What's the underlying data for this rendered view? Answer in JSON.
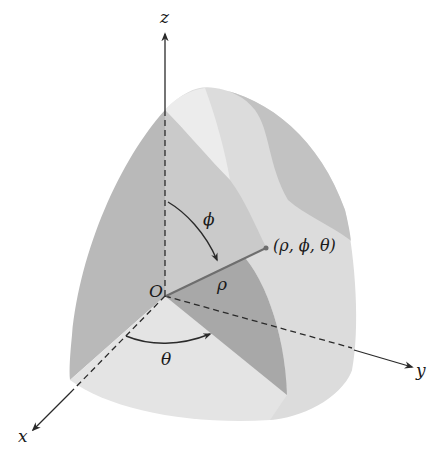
{
  "figure": {
    "type": "spherical-coordinates-diagram",
    "colors": {
      "background": "#ffffff",
      "left_face": "#b9b9b9",
      "outer_shell_light": "#dcdcdc",
      "outer_shell_dark": "#bfbfbf",
      "top_highlight": "#e9e9e9",
      "wedge_dark": "#a8a8a8",
      "floor_light": "#e4e4e4",
      "axis_color": "#2a2a2a",
      "rho_line": "#6e6e6e"
    },
    "axes": {
      "z_label": "z",
      "y_label": "y",
      "x_label": "x"
    },
    "labels": {
      "origin": "O",
      "phi_angle": "ϕ",
      "theta_angle": "θ",
      "rho": "ρ",
      "point": "(ρ, ϕ, θ)"
    }
  }
}
